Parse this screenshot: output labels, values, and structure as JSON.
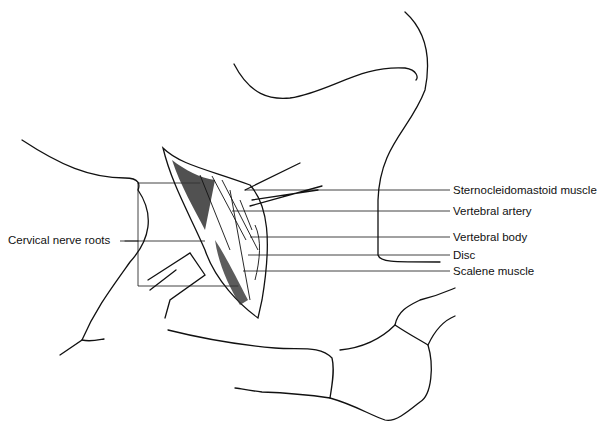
{
  "figure": {
    "type": "anatomical line illustration"
  },
  "labels": {
    "right": [
      {
        "text": "Sternocleidomastoid muscle",
        "x": 453,
        "y": 185
      },
      {
        "text": "Vertebral artery",
        "x": 453,
        "y": 206
      },
      {
        "text": "Vertebral body",
        "x": 453,
        "y": 232
      },
      {
        "text": "Disc",
        "x": 453,
        "y": 250
      },
      {
        "text": "Scalene muscle",
        "x": 453,
        "y": 266
      }
    ],
    "left": [
      {
        "text": "Cervical nerve roots",
        "x": 8,
        "y": 234
      }
    ]
  },
  "colors": {
    "line": "#111111",
    "background": "#ffffff",
    "shading": "#333333"
  }
}
